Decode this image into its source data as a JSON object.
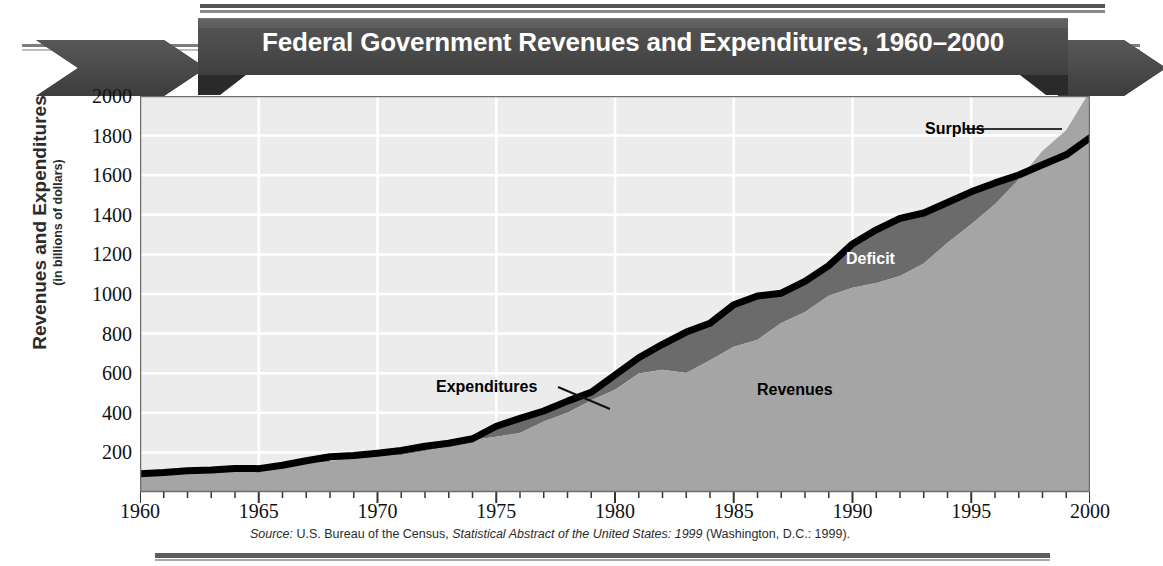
{
  "banner": {
    "title": "Federal Government Revenues and Expenditures, 1960–2000"
  },
  "axes": {
    "y_title": "Revenues and Expenditures",
    "y_subtitle": "(in billions of dollars)",
    "y_ticks": [
      200,
      400,
      600,
      800,
      1000,
      1200,
      1400,
      1600,
      1800,
      2000
    ],
    "x_ticks": [
      1960,
      1965,
      1970,
      1975,
      1980,
      1985,
      1990,
      1995,
      2000
    ]
  },
  "callouts": {
    "surplus": "Surplus",
    "deficit": "Deficit",
    "expenditures": "Expenditures",
    "revenues": "Revenues"
  },
  "source": {
    "prefix": "Source:",
    "agency": " U.S. Bureau of the Census, ",
    "publication": "Statistical Abstract of the United States: 1999",
    "suffix": " (Washington, D.C.: 1999)."
  },
  "colors": {
    "banner": "#4a4a4a",
    "plot_background": "#ececec",
    "gridline": "#ffffff",
    "revenues_fill": "#a5a5a5",
    "deficit_fill": "#6b6b6b",
    "surplus_fill": "#c9c9c9",
    "expenditure_line": "#000000"
  },
  "chart_data": {
    "type": "area",
    "title": "Federal Government Revenues and Expenditures, 1960–2000",
    "xlabel": "",
    "ylabel": "Revenues and Expenditures (in billions of dollars)",
    "xlim": [
      1960,
      2000
    ],
    "ylim": [
      0,
      2000
    ],
    "grid": true,
    "legend": "annotated-inline",
    "x": [
      1960,
      1961,
      1962,
      1963,
      1964,
      1965,
      1966,
      1967,
      1968,
      1969,
      1970,
      1971,
      1972,
      1973,
      1974,
      1975,
      1976,
      1977,
      1978,
      1979,
      1980,
      1981,
      1982,
      1983,
      1984,
      1985,
      1986,
      1987,
      1988,
      1989,
      1990,
      1991,
      1992,
      1993,
      1994,
      1995,
      1996,
      1997,
      1998,
      1999,
      2000
    ],
    "series": [
      {
        "name": "Revenues",
        "values": [
          92,
          94,
          100,
          107,
          113,
          117,
          131,
          149,
          153,
          187,
          193,
          187,
          207,
          231,
          263,
          279,
          298,
          356,
          400,
          463,
          517,
          599,
          618,
          601,
          666,
          734,
          769,
          854,
          909,
          991,
          1032,
          1055,
          1091,
          1154,
          1259,
          1352,
          1453,
          1579,
          1722,
          1827,
          2025
        ]
      },
      {
        "name": "Expenditures",
        "values": [
          92,
          98,
          107,
          111,
          119,
          118,
          135,
          158,
          178,
          184,
          196,
          210,
          231,
          246,
          269,
          332,
          372,
          409,
          459,
          504,
          591,
          678,
          746,
          808,
          852,
          946,
          990,
          1004,
          1064,
          1143,
          1253,
          1324,
          1382,
          1409,
          1462,
          1516,
          1561,
          1601,
          1653,
          1703,
          1789
        ]
      }
    ],
    "annotations": [
      {
        "text": "Deficit",
        "meaning": "Region where expenditures exceed revenues, 1960–1997"
      },
      {
        "text": "Surplus",
        "meaning": "Region where revenues exceed expenditures, 1998–2000"
      },
      {
        "text": "Expenditures",
        "meaning": "Thick black upper boundary line"
      },
      {
        "text": "Revenues",
        "meaning": "Light gray filled area below the revenue curve"
      }
    ]
  }
}
